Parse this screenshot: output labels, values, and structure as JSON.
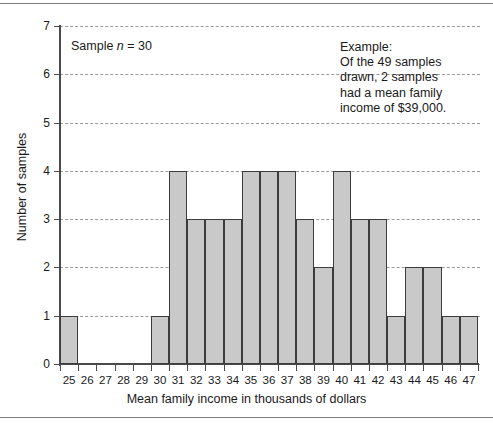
{
  "chart_data": {
    "type": "bar",
    "title": "",
    "xlabel": "Mean family income in thousands of dollars",
    "ylabel": "Number of samples",
    "categories": [
      "25",
      "26",
      "27",
      "28",
      "29",
      "30",
      "31",
      "32",
      "33",
      "34",
      "35",
      "36",
      "37",
      "38",
      "39",
      "40",
      "41",
      "42",
      "43",
      "44",
      "45",
      "46",
      "47"
    ],
    "values": [
      1,
      0,
      0,
      0,
      0,
      1,
      4,
      3,
      3,
      3,
      4,
      4,
      4,
      3,
      2,
      4,
      3,
      3,
      1,
      2,
      2,
      1,
      1
    ],
    "ylim": [
      0,
      7
    ],
    "yticks": [
      "0",
      "1",
      "2",
      "3",
      "4",
      "5",
      "6",
      "7"
    ],
    "grid": "horizontal dashed gridlines at each integer y value",
    "legend": "none",
    "bar_fill": "#c9c9c9",
    "bar_stroke": "#3c3c3c",
    "annotations": {
      "sample_note_prefix": "Sample ",
      "sample_note_var": "n",
      "sample_note_suffix": " = 30",
      "example_text": "Example:\nOf the 49 samples\ndrawn, 2 samples\nhad a mean family\nincome of $39,000."
    }
  },
  "figure": {
    "x_axis_title": "Mean family income in thousands of dollars",
    "y_axis_title": "Number of samples",
    "y_tick_labels": [
      "7",
      "6",
      "5",
      "4",
      "3",
      "2",
      "1",
      "0"
    ],
    "x_tick_labels": [
      "25",
      "26",
      "27",
      "28",
      "29",
      "30",
      "31",
      "32",
      "33",
      "34",
      "35",
      "36",
      "37",
      "38",
      "39",
      "40",
      "41",
      "42",
      "43",
      "44",
      "45",
      "46",
      "47"
    ],
    "sample_note": {
      "prefix": "Sample ",
      "variable": "n",
      "suffix": " = 30"
    },
    "example_note": "Example:\nOf the 49 samples\ndrawn, 2 samples\nhad a mean family\nincome of $39,000."
  }
}
